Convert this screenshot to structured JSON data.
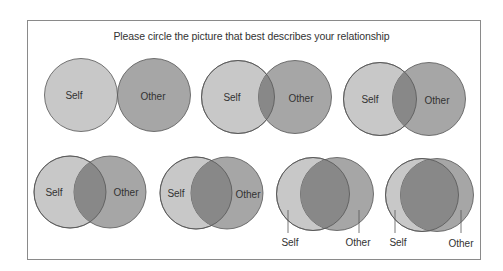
{
  "title": "Please circle the picture that best describes your relationship",
  "colors": {
    "self": "#c8c8c8",
    "other": "#a6a6a6",
    "overlap": "#888888",
    "stroke": "#555555"
  },
  "options": [
    {
      "id": 1,
      "self_label": "Self",
      "other_label": "Other",
      "self": {
        "cx": 81,
        "cy": 95
      },
      "other": {
        "cx": 154,
        "cy": 95
      },
      "r": 36.5
    },
    {
      "id": 2,
      "self_label": "Self",
      "other_label": "Other",
      "self": {
        "cx": 238,
        "cy": 97
      },
      "other": {
        "cx": 295,
        "cy": 97
      },
      "r": 36.5
    },
    {
      "id": 3,
      "self_label": "Self",
      "other_label": "Other",
      "self": {
        "cx": 380,
        "cy": 99
      },
      "other": {
        "cx": 429,
        "cy": 99
      },
      "r": 36.5
    },
    {
      "id": 4,
      "self_label": "Self",
      "other_label": "Other",
      "self": {
        "cx": 70,
        "cy": 192
      },
      "other": {
        "cx": 110,
        "cy": 192
      },
      "r": 36
    },
    {
      "id": 5,
      "self_label": "Self",
      "other_label": "Other",
      "self": {
        "cx": 196,
        "cy": 193
      },
      "other": {
        "cx": 227,
        "cy": 193
      },
      "r": 36
    },
    {
      "id": 6,
      "self_label": "Self",
      "other_label": "Other",
      "self": {
        "cx": 313,
        "cy": 194
      },
      "other": {
        "cx": 337,
        "cy": 194
      },
      "r": 36.5
    },
    {
      "id": 7,
      "self_label": "Self",
      "other_label": "Other",
      "self": {
        "cx": 422,
        "cy": 195
      },
      "other": {
        "cx": 437,
        "cy": 195
      },
      "r": 36.5
    }
  ]
}
